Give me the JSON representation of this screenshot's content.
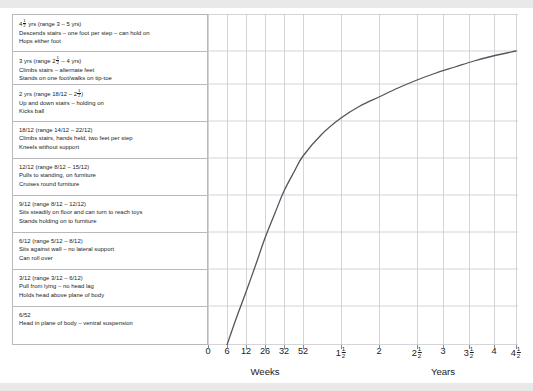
{
  "figure": {
    "background": "#ffffff",
    "band_color": "#e9e9e9",
    "grid_color": "#c9c9cf",
    "curve_color": "#55555a",
    "text_color": "#1b1b1b",
    "panel_border": "#b9b9bd"
  },
  "milestones": [
    {
      "age": "4½ yrs (range 3 – 5 yrs)",
      "age_parts": [
        "4",
        "1",
        "2",
        " yrs (range 3 – 5 yrs)"
      ],
      "lines": [
        "Descends stairs – one foot per step – can hold on",
        "Hops either foot"
      ]
    },
    {
      "age": "3 yrs (range 2½ – 4 yrs)",
      "age_parts": [
        "3 yrs (range 2",
        "1",
        "2",
        " – 4 yrs)"
      ],
      "lines": [
        "Climbs stairs – alternate feet",
        "Stands on one foot/walks on tip-toe"
      ]
    },
    {
      "age": "2 yrs (range 18/12 – 2½)",
      "age_parts": [
        "2 yrs (range 18/12 – 2",
        "1",
        "2",
        ")"
      ],
      "lines": [
        "Up and down stairs – holding on",
        "Kicks ball"
      ]
    },
    {
      "age": "18/12 (range 14/12 – 22/12)",
      "age_parts": [
        "18/12 (range 14/12 – 22/12)",
        "",
        "",
        ""
      ],
      "lines": [
        "Climbs stairs, hands held, two feet per step",
        "Kneels without support"
      ]
    },
    {
      "age": "12/12 (range 8/12 – 15/12)",
      "age_parts": [
        "12/12 (range 8/12 – 15/12)",
        "",
        "",
        ""
      ],
      "lines": [
        "Pulls to standing, on furniture",
        "Cruises round furniture"
      ]
    },
    {
      "age": "9/12 (range 8/12 – 12/12)",
      "age_parts": [
        "9/12 (range 8/12 – 12/12)",
        "",
        "",
        ""
      ],
      "lines": [
        "Sits steadily on floor and can turn to reach toys",
        "Stands holding on to furniture"
      ]
    },
    {
      "age": "6/12 (range 5/12 – 8/12)",
      "age_parts": [
        "6/12 (range 5/12 – 8/12)",
        "",
        "",
        ""
      ],
      "lines": [
        "Sits against wall – no lateral support",
        "Can roll over"
      ]
    },
    {
      "age": "3/12 (range 3/12 – 6/12)",
      "age_parts": [
        "3/12 (range 3/12 – 6/12)",
        "",
        "",
        ""
      ],
      "lines": [
        "Pull from lying – no head lag",
        "Holds head above plane of body"
      ]
    },
    {
      "age": "6/52",
      "age_parts": [
        "6/52",
        "",
        "",
        ""
      ],
      "lines": [
        "Head in plane of body – ventral suspension"
      ]
    }
  ],
  "axis": {
    "x_caption_weeks": "Weeks",
    "x_caption_years": "Years",
    "ticks": [
      {
        "label": "0",
        "whole": "0",
        "num": "",
        "den": "",
        "x": 0
      },
      {
        "label": "6",
        "whole": "6",
        "num": "",
        "den": "",
        "x": 19
      },
      {
        "label": "12",
        "whole": "12",
        "num": "",
        "den": "",
        "x": 38
      },
      {
        "label": "26",
        "whole": "26",
        "num": "",
        "den": "",
        "x": 57
      },
      {
        "label": "32",
        "whole": "32",
        "num": "",
        "den": "",
        "x": 76
      },
      {
        "label": "52",
        "whole": "52",
        "num": "",
        "den": "",
        "x": 95
      },
      {
        "label": "1½",
        "whole": "1",
        "num": "1",
        "den": "2",
        "x": 133
      },
      {
        "label": "2",
        "whole": "2",
        "num": "",
        "den": "",
        "x": 171
      },
      {
        "label": "2½",
        "whole": "2",
        "num": "1",
        "den": "2",
        "x": 209
      },
      {
        "label": "3",
        "whole": "3",
        "num": "",
        "den": "",
        "x": 235
      },
      {
        "label": "3½",
        "whole": "3",
        "num": "1",
        "den": "2",
        "x": 261
      },
      {
        "label": "4",
        "whole": "4",
        "num": "",
        "den": "",
        "x": 286
      },
      {
        "label": "4½",
        "whole": "4",
        "num": "1",
        "den": "2",
        "x": 308
      }
    ],
    "weeks_caption_x": 57,
    "years_caption_x": 235
  },
  "chart_data": {
    "type": "line",
    "xlabel": "Weeks / Years",
    "ylabel": "",
    "grid": true,
    "legend": "none",
    "x_tick_labels": [
      "0",
      "6",
      "12",
      "26",
      "32",
      "52",
      "1½",
      "2",
      "2½",
      "3",
      "3½",
      "4",
      "4½"
    ],
    "x_tick_px": [
      0,
      19,
      38,
      57,
      76,
      95,
      133,
      171,
      209,
      235,
      261,
      286,
      308
    ],
    "y_rowlines_px": [
      0,
      37,
      70,
      107,
      144,
      181,
      218,
      255,
      292,
      331
    ],
    "series": [
      {
        "name": "Developmental progress curve",
        "points_px": [
          [
            19,
            331
          ],
          [
            28,
            305
          ],
          [
            38,
            278
          ],
          [
            48,
            250
          ],
          [
            57,
            224
          ],
          [
            67,
            199
          ],
          [
            76,
            177
          ],
          [
            86,
            158
          ],
          [
            95,
            142
          ],
          [
            114,
            120
          ],
          [
            133,
            104
          ],
          [
            152,
            92
          ],
          [
            171,
            83
          ],
          [
            190,
            74
          ],
          [
            209,
            66
          ],
          [
            228,
            59
          ],
          [
            247,
            53
          ],
          [
            266,
            47
          ],
          [
            285,
            42
          ],
          [
            308,
            37
          ]
        ],
        "milestone_ages": [
          "6/52",
          "3/12",
          "6/12",
          "9/12",
          "12/12",
          "18/12",
          "2 yrs",
          "3 yrs",
          "4½ yrs"
        ]
      }
    ]
  }
}
